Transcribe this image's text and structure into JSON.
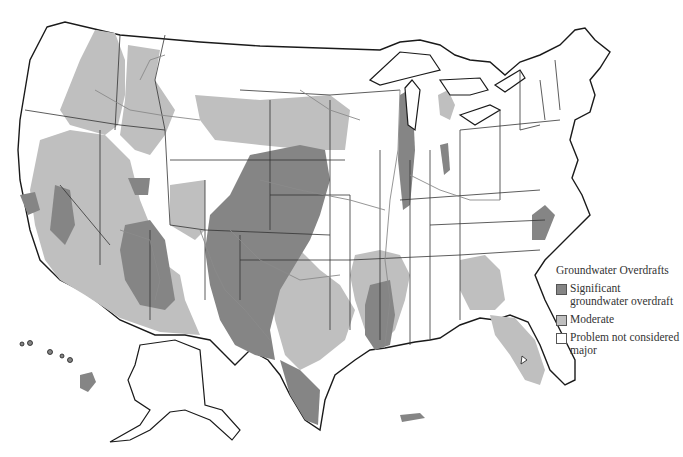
{
  "map": {
    "title": "Groundwater Overdrafts",
    "region": "United States",
    "colors": {
      "significant": "#858585",
      "moderate": "#bfbfbf",
      "none": "#ffffff",
      "outline": "#1a1a1a",
      "rivers": "#8a8a8a"
    }
  },
  "legend": {
    "title": "Groundwater Overdrafts",
    "items": [
      {
        "label": "Significant groundwater overdraft",
        "color": "#858585"
      },
      {
        "label": "Moderate",
        "color": "#bfbfbf"
      },
      {
        "label": "Problem not considered major",
        "color": "#ffffff"
      }
    ]
  },
  "insets": [
    "Alaska",
    "Hawaii",
    "Puerto Rico"
  ]
}
